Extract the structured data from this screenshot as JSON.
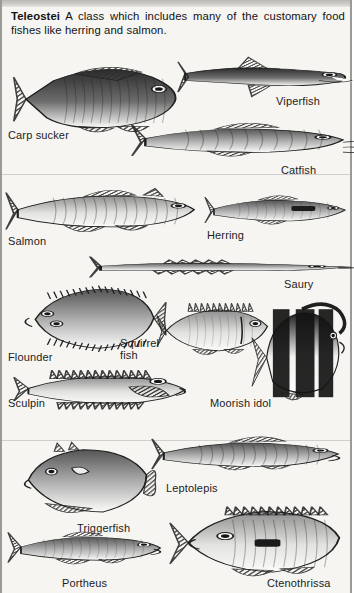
{
  "plate": {
    "title_term": "Teleostei",
    "description": " A class which includes many of the customary food fishes like herring and salmon.",
    "background_color": "#f6f5f2",
    "ink_color": "#1c1c1c",
    "border_color": "#9a9a96"
  },
  "specimens": [
    {
      "name": "Carp sucker",
      "label": "Carp sucker",
      "label_x": 6,
      "label_y": 130,
      "fig_x": 10,
      "fig_y": 55,
      "fig_w": 175,
      "fig_h": 85,
      "kind": "deep-bodied",
      "tone": "dark"
    },
    {
      "name": "Viperfish",
      "label": "Viperfish",
      "label_x": 274,
      "label_y": 96,
      "fig_x": 176,
      "fig_y": 48,
      "fig_w": 176,
      "fig_h": 58,
      "kind": "viper",
      "tone": "dark"
    },
    {
      "name": "Catfish",
      "label": "Catfish",
      "label_x": 279,
      "label_y": 165,
      "fig_x": 130,
      "fig_y": 110,
      "fig_w": 222,
      "fig_h": 62,
      "kind": "catfish",
      "tone": "mid"
    },
    {
      "name": "Salmon",
      "label": "Salmon",
      "label_x": 6,
      "label_y": 236,
      "fig_x": 4,
      "fig_y": 178,
      "fig_w": 196,
      "fig_h": 66,
      "kind": "salmon",
      "tone": "light"
    },
    {
      "name": "Herring",
      "label": "Herring",
      "label_x": 205,
      "label_y": 230,
      "fig_x": 203,
      "fig_y": 186,
      "fig_w": 149,
      "fig_h": 50,
      "kind": "herring",
      "tone": "mid"
    },
    {
      "name": "Saury",
      "label": "Saury",
      "label_x": 282,
      "label_y": 279,
      "fig_x": 88,
      "fig_y": 245,
      "fig_w": 264,
      "fig_h": 44,
      "kind": "saury",
      "tone": "mid"
    },
    {
      "name": "Flounder",
      "label": "Flounder",
      "label_x": 6,
      "label_y": 352,
      "fig_x": 12,
      "fig_y": 282,
      "fig_w": 152,
      "fig_h": 72,
      "kind": "flounder",
      "tone": "mid"
    },
    {
      "name": "Squirrel fish",
      "label": "Squirrel\nfish",
      "label_x": 118,
      "label_y": 338,
      "fig_x": 155,
      "fig_y": 295,
      "fig_w": 120,
      "fig_h": 68,
      "kind": "squirrel",
      "tone": "light"
    },
    {
      "name": "Moorish idol",
      "label": "Moorish idol",
      "label_x": 208,
      "label_y": 398,
      "fig_x": 248,
      "fig_y": 296,
      "fig_w": 104,
      "fig_h": 110,
      "kind": "idol",
      "tone": "striped"
    },
    {
      "name": "Sculpin",
      "label": "Sculpin",
      "label_x": 6,
      "label_y": 398,
      "fig_x": 12,
      "fig_y": 352,
      "fig_w": 180,
      "fig_h": 70,
      "kind": "sculpin",
      "tone": "light"
    },
    {
      "name": "Leptolepis",
      "label": "Leptolepis",
      "label_x": 164,
      "label_y": 483,
      "fig_x": 150,
      "fig_y": 425,
      "fig_w": 196,
      "fig_h": 58,
      "kind": "leptolepis",
      "tone": "mid"
    },
    {
      "name": "Triggerfish",
      "label": "Triggerfish",
      "label_x": 75,
      "label_y": 523,
      "fig_x": 12,
      "fig_y": 438,
      "fig_w": 144,
      "fig_h": 84,
      "kind": "trigger",
      "tone": "mid"
    },
    {
      "name": "Portheus",
      "label": "Portheus",
      "label_x": 60,
      "label_y": 578,
      "fig_x": 6,
      "fig_y": 520,
      "fig_w": 162,
      "fig_h": 56,
      "kind": "portheus",
      "tone": "mid"
    },
    {
      "name": "Ctenothrissa",
      "label": "Ctenothrissa",
      "label_x": 265,
      "label_y": 578,
      "fig_x": 168,
      "fig_y": 500,
      "fig_w": 184,
      "fig_h": 82,
      "kind": "ctenothrissa",
      "tone": "light"
    }
  ]
}
